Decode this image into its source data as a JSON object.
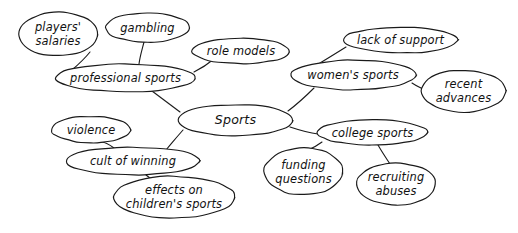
{
  "diagram": {
    "type": "mind-map",
    "style": {
      "background": "#ffffff",
      "stroke": "#1a1a1a",
      "text": "#111111",
      "node_fill": "#ffffff"
    },
    "root": "Sports",
    "nodes": [
      {
        "id": "sports",
        "label": "Sports",
        "lines": [
          "Sports"
        ],
        "cx": 235.5,
        "cy": 120.0,
        "rx": 58.0,
        "ry": 15.5,
        "level": 0
      },
      {
        "id": "professional",
        "label": "professional sports",
        "lines": [
          "professional sports"
        ],
        "cx": 125.5,
        "cy": 78.0,
        "rx": 70.5,
        "ry": 14.0,
        "level": 1
      },
      {
        "id": "womens",
        "label": "women's sports",
        "lines": [
          "women's sports"
        ],
        "cx": 353.0,
        "cy": 75.0,
        "rx": 63.0,
        "ry": 15.0,
        "level": 1
      },
      {
        "id": "cult",
        "label": "cult of winning",
        "lines": [
          "cult of winning"
        ],
        "cx": 133.0,
        "cy": 161.0,
        "rx": 67.0,
        "ry": 14.0,
        "level": 1
      },
      {
        "id": "college",
        "label": "college sports",
        "lines": [
          "college sports"
        ],
        "cx": 372.5,
        "cy": 132.5,
        "rx": 55.5,
        "ry": 12.5,
        "level": 1
      },
      {
        "id": "players-salaries",
        "label": "players' salaries",
        "lines": [
          "players'",
          "salaries"
        ],
        "cx": 58.0,
        "cy": 34.0,
        "rx": 40.0,
        "ry": 22.0,
        "level": 2
      },
      {
        "id": "gambling",
        "label": "gambling",
        "lines": [
          "gambling"
        ],
        "cx": 147.5,
        "cy": 27.5,
        "rx": 42.5,
        "ry": 14.5,
        "level": 2
      },
      {
        "id": "role-models",
        "label": "role models",
        "lines": [
          "role models"
        ],
        "cx": 241.0,
        "cy": 51.0,
        "rx": 49.0,
        "ry": 13.0,
        "level": 2
      },
      {
        "id": "lack-of-support",
        "label": "lack of support",
        "lines": [
          "lack of support"
        ],
        "cx": 400.5,
        "cy": 40.0,
        "rx": 57.5,
        "ry": 13.0,
        "level": 2
      },
      {
        "id": "recent-advances",
        "label": "recent advances",
        "lines": [
          "recent",
          "advances"
        ],
        "cx": 463.5,
        "cy": 91.0,
        "rx": 42.5,
        "ry": 21.0,
        "level": 2
      },
      {
        "id": "violence",
        "label": "violence",
        "lines": [
          "violence"
        ],
        "cx": 91.0,
        "cy": 129.5,
        "rx": 40.0,
        "ry": 13.5,
        "level": 2
      },
      {
        "id": "effects-children",
        "label": "effects on children's sports",
        "lines": [
          "effects on",
          "children's sports"
        ],
        "cx": 174.0,
        "cy": 197.0,
        "rx": 61.0,
        "ry": 21.0,
        "level": 2
      },
      {
        "id": "funding-questions",
        "label": "funding questions",
        "lines": [
          "funding",
          "questions"
        ],
        "cx": 303.5,
        "cy": 171.5,
        "rx": 39.5,
        "ry": 23.5,
        "level": 2
      },
      {
        "id": "recruiting-abuses",
        "label": "recruiting abuses",
        "lines": [
          "recruiting",
          "abuses"
        ],
        "cx": 396.0,
        "cy": 184.0,
        "rx": 40.0,
        "ry": 21.0,
        "level": 2
      }
    ],
    "edges": [
      {
        "from": "sports",
        "to": "professional",
        "path": "M 180 112 C 168 103, 160 97, 152 91"
      },
      {
        "from": "sports",
        "to": "womens",
        "path": "M 288 111 C 300 102, 306 96, 314 88"
      },
      {
        "from": "sports",
        "to": "cult",
        "path": "M 183 130 C 175 139, 172 143, 166 150"
      },
      {
        "from": "sports",
        "to": "college",
        "path": "M 290 127 C 302 131, 310 133, 318 134"
      },
      {
        "from": "professional",
        "to": "players-salaries",
        "path": "M 72 70 C 80 63, 86 57, 90 52"
      },
      {
        "from": "professional",
        "to": "gambling",
        "path": "M 139 64 C 140 56, 142 50, 144 42"
      },
      {
        "from": "professional",
        "to": "role-models",
        "path": "M 194 72 C 202 68, 208 64, 214 59"
      },
      {
        "from": "womens",
        "to": "lack-of-support",
        "path": "M 320 63 C 330 57, 338 52, 346 47"
      },
      {
        "from": "womens",
        "to": "recent-advances",
        "path": "M 412 83 C 418 87, 423 89, 428 91"
      },
      {
        "from": "cult",
        "to": "violence",
        "path": "M 114 148 C 110 145, 106 142, 101 142"
      },
      {
        "from": "cult",
        "to": "effects-children",
        "path": "M 146 175 C 152 180, 158 183, 164 186"
      },
      {
        "from": "college",
        "to": "funding-questions",
        "path": "M 322 142 C 318 145, 313 148, 308 150"
      },
      {
        "from": "college",
        "to": "recruiting-abuses",
        "path": "M 378 145 C 382 152, 386 158, 390 164"
      }
    ]
  }
}
